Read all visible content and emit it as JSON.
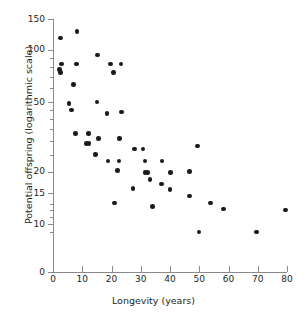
{
  "chart_data": {
    "type": "scatter",
    "title": "",
    "xlabel": "Longevity (years)",
    "ylabel": "Potential offspring (logarithmic scale)",
    "xlim": [
      0,
      80
    ],
    "ylim": [
      8,
      150
    ],
    "yscale": "log",
    "xscale": "linear",
    "grid": false,
    "legend": null,
    "xticks": [
      0,
      10,
      20,
      30,
      40,
      50,
      60,
      70,
      80
    ],
    "xticklabels": [
      "0",
      "10",
      "20",
      "30",
      "40",
      "50",
      "60",
      "70",
      "80"
    ],
    "yticks": [
      150,
      100,
      50,
      20,
      15,
      10,
      0
    ],
    "yticklabels": [
      "150",
      "100",
      "50",
      "20",
      "15",
      "10",
      "0"
    ],
    "y_minor_ticks": [
      90,
      80,
      70,
      60,
      45,
      40,
      35,
      30,
      25,
      13,
      12,
      11,
      9
    ],
    "axis_break_on_y": true,
    "marker": "filled-circle",
    "marker_color": "#1a1a1a",
    "axis_color": "#8a8a8a",
    "points": [
      {
        "x": 2.6,
        "y": 117
      },
      {
        "x": 8.2,
        "y": 127
      },
      {
        "x": 2.3,
        "y": 77
      },
      {
        "x": 2.6,
        "y": 74
      },
      {
        "x": 3.0,
        "y": 83
      },
      {
        "x": 8.0,
        "y": 83
      },
      {
        "x": 15.3,
        "y": 93
      },
      {
        "x": 19.6,
        "y": 83
      },
      {
        "x": 23.2,
        "y": 83
      },
      {
        "x": 20.6,
        "y": 74
      },
      {
        "x": 7.1,
        "y": 63
      },
      {
        "x": 5.5,
        "y": 49
      },
      {
        "x": 6.3,
        "y": 45
      },
      {
        "x": 15.0,
        "y": 50
      },
      {
        "x": 18.5,
        "y": 43
      },
      {
        "x": 23.5,
        "y": 44
      },
      {
        "x": 7.6,
        "y": 33
      },
      {
        "x": 12.2,
        "y": 33
      },
      {
        "x": 15.5,
        "y": 31
      },
      {
        "x": 11.5,
        "y": 29
      },
      {
        "x": 12.3,
        "y": 29
      },
      {
        "x": 22.8,
        "y": 31
      },
      {
        "x": 27.8,
        "y": 27
      },
      {
        "x": 30.8,
        "y": 27
      },
      {
        "x": 49.5,
        "y": 28
      },
      {
        "x": 14.5,
        "y": 25
      },
      {
        "x": 18.8,
        "y": 23
      },
      {
        "x": 22.5,
        "y": 23
      },
      {
        "x": 31.5,
        "y": 23
      },
      {
        "x": 37.3,
        "y": 23
      },
      {
        "x": 22.0,
        "y": 20.3
      },
      {
        "x": 31.5,
        "y": 19.8
      },
      {
        "x": 32.4,
        "y": 19.8
      },
      {
        "x": 40.2,
        "y": 19.8
      },
      {
        "x": 46.7,
        "y": 20
      },
      {
        "x": 33.2,
        "y": 18
      },
      {
        "x": 37.0,
        "y": 17
      },
      {
        "x": 27.3,
        "y": 16
      },
      {
        "x": 40.0,
        "y": 15.8
      },
      {
        "x": 46.7,
        "y": 14.5
      },
      {
        "x": 21.0,
        "y": 13.2
      },
      {
        "x": 34.0,
        "y": 12.6
      },
      {
        "x": 53.8,
        "y": 13.2
      },
      {
        "x": 58.2,
        "y": 12.2
      },
      {
        "x": 79.5,
        "y": 12.0
      },
      {
        "x": 49.9,
        "y": 9.0
      },
      {
        "x": 69.6,
        "y": 9.0
      }
    ]
  }
}
